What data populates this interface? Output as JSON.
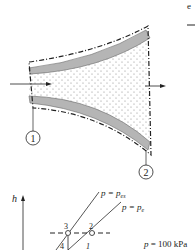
{
  "figure": {
    "corner_label": "e",
    "nozzle": {
      "station_labels": [
        "1",
        "2"
      ],
      "flow_direction": "left-to-right"
    },
    "hs_diagram": {
      "y_axis_label": "h",
      "points": [
        "3",
        "2",
        "4",
        "1"
      ],
      "isobars": [
        {
          "label_prefix": "p = p",
          "label_sub": "es"
        },
        {
          "label_prefix": "p = p",
          "label_sub": "e"
        }
      ],
      "pressure_note": "p = 100 kPa"
    }
  },
  "colors": {
    "wall_fill": "#b5b5b5",
    "line": "#222222",
    "dots": "#888888"
  }
}
